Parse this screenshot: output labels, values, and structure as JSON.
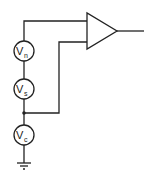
{
  "diagram": {
    "type": "circuit",
    "sources": [
      {
        "id": "vn",
        "label": "V",
        "subscript": "n"
      },
      {
        "id": "vs",
        "label": "V",
        "subscript": "s"
      },
      {
        "id": "vc",
        "label": "V",
        "subscript": "c"
      }
    ],
    "amplifier": {
      "symbol": "triangle"
    },
    "ground": {
      "symbol": "ground"
    },
    "colors": {
      "stroke": "#222222",
      "background": "#ffffff"
    }
  }
}
